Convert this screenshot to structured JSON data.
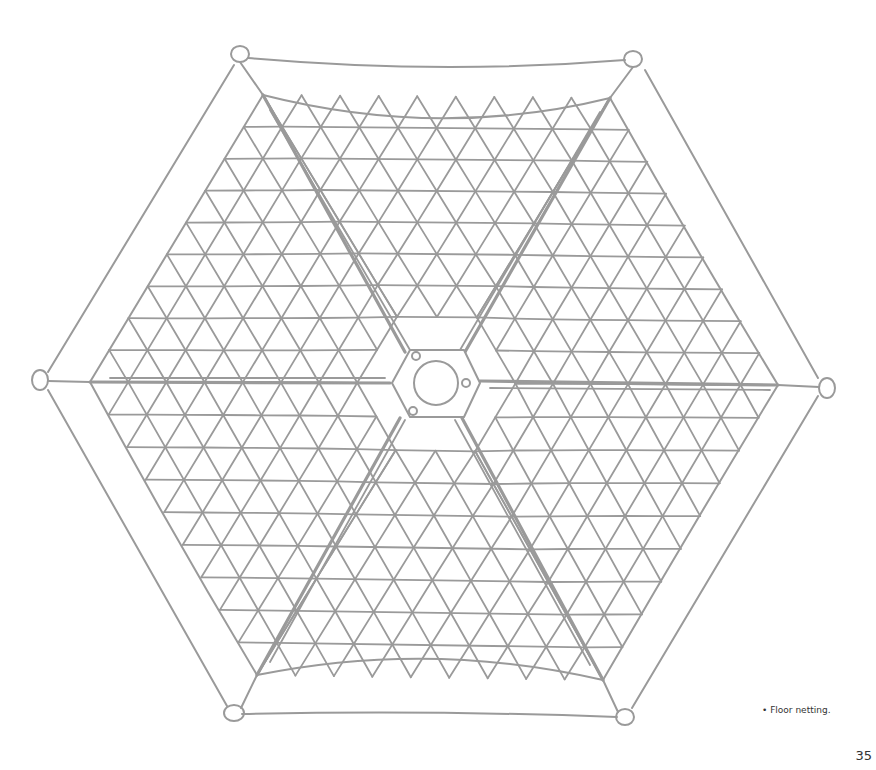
{
  "figure": {
    "line_color": "#9a9a9a",
    "center": [
      437,
      383
    ],
    "anchor_points": [
      {
        "x": 240,
        "y": 55
      },
      {
        "x": 633,
        "y": 58
      },
      {
        "x": 827,
        "y": 388
      },
      {
        "x": 625,
        "y": 717
      },
      {
        "x": 234,
        "y": 713
      },
      {
        "x": 40,
        "y": 380
      }
    ],
    "hub": {
      "shape": "hexagon",
      "ring": "circle",
      "bolt_holes": 3
    }
  },
  "caption": "• Floor netting.",
  "page_number": "35"
}
